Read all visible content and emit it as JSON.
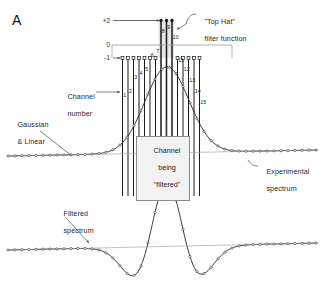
{
  "figure": {
    "panel_letter": "A",
    "background": "#ffffff",
    "ink": "#1a1a1a",
    "grey_line": "#9a9a9a"
  },
  "axis": {
    "ticks": [
      {
        "label": "+2",
        "y": 20.5
      },
      {
        "label": "0",
        "y": 45.0
      },
      {
        "label": "-1",
        "y": 58.0
      }
    ],
    "zero_line_color": "#8e8e8e"
  },
  "annotations": {
    "top_hat": {
      "line1": "\"Top Hat\"",
      "line2": "filter function"
    },
    "channel_number": {
      "line1": "Channel",
      "line2": "number"
    },
    "gaussian_linear": {
      "line1": "Gaussian",
      "line2": "& Linear"
    },
    "channel_being_filtered": {
      "line1": "Channel",
      "line2": "being",
      "line3": "\"filtered\""
    },
    "experimental_spectrum": {
      "line1": "Experimental",
      "line2": "spectrum"
    },
    "filtered_spectrum": {
      "line1": "Filtered",
      "line2": "spectrum"
    }
  },
  "chart_data": {
    "type": "line",
    "xlabel": "Channel number",
    "ylabel": "Filter weight",
    "ylim": [
      -1,
      2
    ],
    "grid": false,
    "legend": "none",
    "channels": {
      "numbers": [
        1,
        2,
        3,
        4,
        5,
        6,
        7,
        8,
        9,
        10,
        11,
        12,
        13,
        14,
        15
      ],
      "weights": [
        -1,
        -1,
        -1,
        -1,
        -1,
        -1,
        -1,
        2,
        2,
        2,
        -1,
        -1,
        -1,
        -1,
        -1
      ],
      "x_px": [
        122.5,
        128.0,
        133.5,
        139.0,
        144.5,
        150.0,
        155.5,
        161.0,
        166.5,
        172.0,
        177.5,
        183.0,
        188.5,
        194.0,
        199.5
      ],
      "positive_label": "+2",
      "negative_label": "-1",
      "zero_label": "0",
      "positive_channels": [
        8,
        9,
        10
      ],
      "negative_channels": [
        1,
        2,
        3,
        4,
        5,
        6,
        7,
        11,
        12,
        13,
        14,
        15
      ]
    },
    "series": [
      {
        "name": "Experimental spectrum",
        "kind": "gaussian-plus-linear",
        "marker": "open-circle",
        "baseline_left_y": 156.0,
        "baseline_right_y": 150.0,
        "peak_x": 167.0,
        "peak_y": 70.0,
        "sigma_px": 22.0,
        "x_start": 8,
        "x_end": 318
      },
      {
        "name": "Filtered spectrum",
        "kind": "mexican-hat",
        "marker": "open-circle",
        "baseline_left_y": 250.0,
        "baseline_right_y": 243.0,
        "peak_x": 167.0,
        "peak_top_y": 186.0,
        "trough_left_x": 126.0,
        "trough_right_x": 209.0,
        "trough_depth_px": 28.0,
        "x_start": 8,
        "x_end": 318
      }
    ]
  }
}
